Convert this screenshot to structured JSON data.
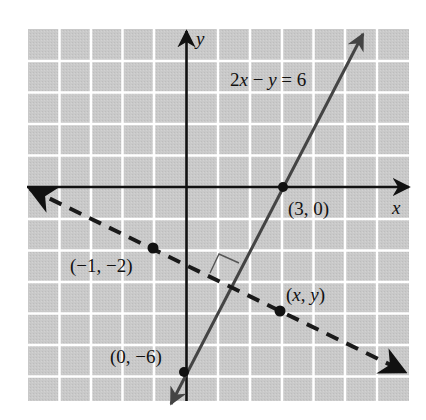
{
  "figure": {
    "type": "coordinate-plane",
    "axes": {
      "x_label": "x",
      "y_label": "y",
      "grid_x_range": [
        -5,
        7
      ],
      "grid_y_range": [
        -6.7,
        5
      ]
    },
    "solid_line": {
      "equation": "2x − y = 6",
      "equation_parts": [
        "2",
        "x",
        " − ",
        "y",
        " = 6"
      ],
      "color": "#444444",
      "points": [
        "(3, 0)",
        "(0, −6)"
      ]
    },
    "dashed_line": {
      "color": "#1a1a1a",
      "points": [
        "(−1, −2)",
        "(x, y)"
      ],
      "perpendicular_marker": true
    },
    "labels": {
      "p_3_0": "(3, 0)",
      "p_0_m6": "(0, −6)",
      "p_m1_m2": "(−1, −2)",
      "p_xy_open": "(",
      "p_xy_x": "x",
      "p_xy_comma": ", ",
      "p_xy_y": "y",
      "p_xy_close": ")"
    },
    "colors": {
      "grid_background": "#c9c9c9",
      "grid_lines": "#ffffff",
      "axes": "#111111"
    }
  }
}
